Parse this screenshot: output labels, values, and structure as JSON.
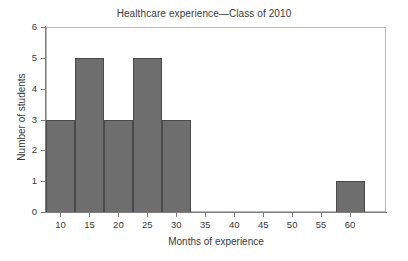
{
  "chart_data": {
    "type": "bar",
    "title": "Healthcare experience—Class of 2010",
    "xlabel": "Months of experience",
    "ylabel": "Number of students",
    "grid": false,
    "legend": null,
    "xlim": [
      7.5,
      66.2
    ],
    "ylim": [
      0,
      6
    ],
    "xticks": [
      10,
      15,
      20,
      25,
      30,
      35,
      40,
      45,
      50,
      55,
      60
    ],
    "xticklabels": [
      "10",
      "15",
      "20",
      "25",
      "30",
      "35",
      "40",
      "45",
      "50",
      "55",
      "60"
    ],
    "yticks": [
      0,
      1,
      2,
      3,
      4,
      5,
      6
    ],
    "yticklabels": [
      "0",
      "1",
      "2",
      "3",
      "4",
      "5",
      "6"
    ],
    "bin_width": 5,
    "categories": [
      "7.5–12.5",
      "12.5–17.5",
      "17.5–22.5",
      "22.5–27.5",
      "27.5–32.5",
      "57.5–62.5"
    ],
    "bins": [
      {
        "label": "7.5–12.5",
        "start": 7.5,
        "end": 12.5,
        "value": 3
      },
      {
        "label": "12.5–17.5",
        "start": 12.5,
        "end": 17.5,
        "value": 5
      },
      {
        "label": "17.5–22.5",
        "start": 17.5,
        "end": 22.5,
        "value": 3
      },
      {
        "label": "22.5–27.5",
        "start": 22.5,
        "end": 27.5,
        "value": 5
      },
      {
        "label": "27.5–32.5",
        "start": 27.5,
        "end": 32.5,
        "value": 3
      },
      {
        "label": "57.5–62.5",
        "start": 57.5,
        "end": 62.5,
        "value": 1
      }
    ],
    "values": [
      3,
      5,
      3,
      5,
      3,
      1
    ],
    "colors": {
      "bar_fill": "#6e6e6e",
      "bar_edge": "#4a4a4a",
      "axis": "#7d7d7d",
      "frame": "#b8b8b8",
      "text": "#3a3a3a",
      "background": "#ffffff"
    }
  }
}
